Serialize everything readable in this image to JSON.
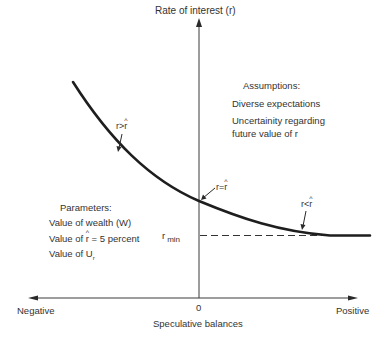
{
  "diagram": {
    "y_axis_label": "Rate of interest (r)",
    "x_axis_label": "Speculative balances",
    "x_origin_label": "0",
    "x_negative_label": "Negative",
    "x_positive_label": "Positive",
    "r_min_label_main": "r",
    "r_min_label_sub": "min",
    "curve_labels": {
      "high": {
        "left": "r",
        "op": ">",
        "right": "r"
      },
      "equal": {
        "left": "r",
        "op": "=",
        "right": "r"
      },
      "low": {
        "left": "r",
        "op": "<",
        "right": "r"
      }
    },
    "assumptions": {
      "title": "Assumptions:",
      "lines": [
        "Diverse expectations",
        "Uncertainity regarding",
        "future value of r"
      ]
    },
    "parameters": {
      "title": "Parameters:",
      "line1": "Value of wealth (W)",
      "line2_prefix": "Value of ",
      "line2_var": "r",
      "line2_suffix": " = 5 percent",
      "line3": "Value of U",
      "line3_sub": "r"
    },
    "colors": {
      "ink": "#2a2a2a",
      "background": "#ffffff"
    }
  }
}
